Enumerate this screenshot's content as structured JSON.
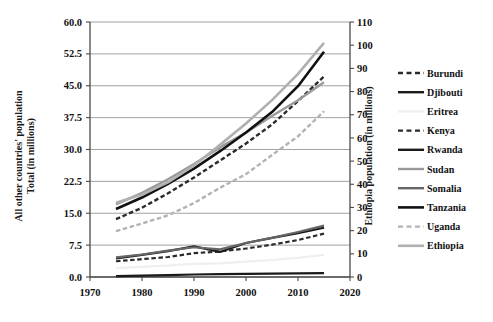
{
  "chart_data": {
    "type": "line",
    "title": "",
    "xlabel": "",
    "ylabel": "All other countries' population\nTotal (in millions)",
    "y2label": "Ethiopia population (in millions)",
    "xlim": [
      1970,
      2020
    ],
    "ylim": [
      0.0,
      60.0
    ],
    "y2lim": [
      0,
      110
    ],
    "xticks": [
      1970,
      1980,
      1990,
      2000,
      2010,
      2020
    ],
    "xtick_labels": [
      "1970",
      "1980",
      "1990",
      "2000",
      "2010",
      "2020"
    ],
    "yticks": [
      0.0,
      7.5,
      15.0,
      22.5,
      30.0,
      37.5,
      45.0,
      52.5,
      60.0
    ],
    "ytick_labels": [
      "0.0",
      "7.5",
      "15.0",
      "22.5",
      "30.0",
      "37.5",
      "45.0",
      "52.5",
      "60.0"
    ],
    "y2ticks": [
      0,
      10,
      20,
      30,
      40,
      50,
      60,
      70,
      80,
      90,
      100,
      110
    ],
    "y2tick_labels": [
      "0",
      "10",
      "20",
      "30",
      "40",
      "50",
      "60",
      "70",
      "80",
      "90",
      "100",
      "110"
    ],
    "grid": "horizontal",
    "legend_position": "right",
    "x": [
      1975,
      1980,
      1985,
      1990,
      1995,
      2000,
      2005,
      2010,
      2015
    ],
    "series": [
      {
        "name": "Burundi",
        "axis": "left",
        "color": "#2b2b2b",
        "style": "dashed",
        "width": 2.2,
        "values": [
          3.7,
          4.2,
          4.7,
          5.6,
          6.0,
          6.7,
          7.6,
          8.7,
          10.2
        ]
      },
      {
        "name": "Djibouti",
        "axis": "left",
        "color": "#1a1a1a",
        "style": "solid",
        "width": 2.2,
        "values": [
          0.21,
          0.34,
          0.42,
          0.59,
          0.66,
          0.72,
          0.79,
          0.85,
          0.93
        ]
      },
      {
        "name": "Eritrea",
        "axis": "left",
        "color": "#efefef",
        "style": "solid",
        "width": 2.2,
        "values": [
          2.1,
          2.4,
          2.7,
          3.1,
          3.2,
          3.6,
          4.0,
          4.5,
          5.2
        ]
      },
      {
        "name": "Kenya",
        "axis": "left",
        "color": "#2b2b2b",
        "style": "dashed",
        "width": 2.4,
        "values": [
          13.6,
          16.3,
          19.7,
          23.4,
          27.4,
          31.4,
          35.9,
          41.4,
          47.2
        ]
      },
      {
        "name": "Rwanda",
        "axis": "left",
        "color": "#1a1a1a",
        "style": "solid",
        "width": 2.2,
        "values": [
          4.4,
          5.2,
          6.1,
          7.2,
          5.9,
          8.0,
          9.2,
          10.3,
          11.6
        ]
      },
      {
        "name": "Sudan",
        "axis": "left",
        "color": "#9a9a9a",
        "style": "solid",
        "width": 2.4,
        "values": [
          17.1,
          19.8,
          23.0,
          26.6,
          30.5,
          34.0,
          37.9,
          41.6,
          45.8
        ]
      },
      {
        "name": "Somalia",
        "axis": "left",
        "color": "#666666",
        "style": "solid",
        "width": 2.2,
        "values": [
          4.6,
          5.3,
          6.2,
          7.0,
          6.5,
          8.0,
          9.2,
          10.6,
          12.1
        ]
      },
      {
        "name": "Tanzania",
        "axis": "left",
        "color": "#111111",
        "style": "solid",
        "width": 2.6,
        "values": [
          16.0,
          18.7,
          21.9,
          25.5,
          29.6,
          34.0,
          38.8,
          44.9,
          53.0
        ]
      },
      {
        "name": "Uganda",
        "axis": "left",
        "color": "#b3b3b3",
        "style": "dashed",
        "width": 2.4,
        "values": [
          10.8,
          12.6,
          14.5,
          17.4,
          21.0,
          24.2,
          28.7,
          33.1,
          39.0
        ]
      },
      {
        "name": "Ethiopia",
        "axis": "right",
        "color": "#b0b0b0",
        "style": "solid",
        "width": 2.6,
        "values": [
          32.0,
          35.6,
          40.8,
          48.1,
          57.0,
          66.2,
          76.3,
          87.6,
          101.0
        ]
      }
    ]
  },
  "legend": {
    "items": [
      {
        "label": "Burundi"
      },
      {
        "label": "Djibouti"
      },
      {
        "label": "Eritrea"
      },
      {
        "label": "Kenya"
      },
      {
        "label": "Rwanda"
      },
      {
        "label": "Sudan"
      },
      {
        "label": "Somalia"
      },
      {
        "label": "Tanzania"
      },
      {
        "label": "Uganda"
      },
      {
        "label": "Ethiopia"
      }
    ]
  },
  "axes": {
    "left_title_line1": "All other countries' population",
    "left_title_line2": "Total (in millions)",
    "right_title": "Ethiopia population (in millions)"
  }
}
